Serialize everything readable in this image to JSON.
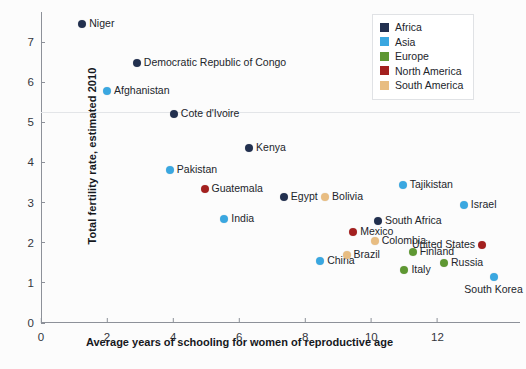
{
  "chart_data": {
    "type": "scatter",
    "title": "",
    "xlabel": "Average years of schooling for women of reproductive age",
    "ylabel": "Total fertility rate, estimated 2010",
    "xlim": [
      0,
      14.5
    ],
    "ylim": [
      0,
      7.75
    ],
    "xticks": [
      0,
      2,
      4,
      6,
      8,
      10,
      12
    ],
    "yticks": [
      0,
      1,
      2,
      3,
      4,
      5,
      6,
      7
    ],
    "xtick_labels": [
      "0",
      "2",
      "4",
      "6",
      "8",
      "10",
      "12"
    ],
    "ytick_labels": [
      "0",
      "1",
      "2",
      "3",
      "4",
      "5",
      "6",
      "7"
    ],
    "grid": "single faint horizontal rule at y=5.25",
    "hrule_y": 5.25,
    "legend_position": "top-right",
    "legend": [
      {
        "name": "Africa",
        "color": "#22304f"
      },
      {
        "name": "Asia",
        "color": "#3aa7e0"
      },
      {
        "name": "Europe",
        "color": "#5e9732"
      },
      {
        "name": "North America",
        "color": "#a3201f"
      },
      {
        "name": "South America",
        "color": "#e8bd82"
      }
    ],
    "series": [
      {
        "name": "Africa",
        "color": "#22304f",
        "points": [
          {
            "label": "Niger",
            "x": 1.25,
            "y": 7.45,
            "label_pos": "right"
          },
          {
            "label": "Democratic Republic of Congo",
            "x": 2.9,
            "y": 6.47,
            "label_pos": "right"
          },
          {
            "label": "Cote d'Ivoire",
            "x": 4.02,
            "y": 5.2,
            "label_pos": "right"
          },
          {
            "label": "Kenya",
            "x": 6.3,
            "y": 4.35,
            "label_pos": "right"
          },
          {
            "label": "Egypt",
            "x": 7.35,
            "y": 3.15,
            "label_pos": "right"
          },
          {
            "label": "South Africa",
            "x": 10.2,
            "y": 2.55,
            "label_pos": "right"
          }
        ]
      },
      {
        "name": "Asia",
        "color": "#3aa7e0",
        "points": [
          {
            "label": "Afghanistan",
            "x": 2.0,
            "y": 5.78,
            "label_pos": "right"
          },
          {
            "label": "Pakistan",
            "x": 3.9,
            "y": 3.82,
            "label_pos": "right"
          },
          {
            "label": "India",
            "x": 5.55,
            "y": 2.6,
            "label_pos": "right"
          },
          {
            "label": "Tajikistan",
            "x": 10.95,
            "y": 3.45,
            "label_pos": "right"
          },
          {
            "label": "Israel",
            "x": 12.8,
            "y": 2.95,
            "label_pos": "right"
          },
          {
            "label": "China",
            "x": 8.45,
            "y": 1.55,
            "label_pos": "right"
          },
          {
            "label": "South Korea",
            "x": 13.7,
            "y": 1.15,
            "label_pos": "below"
          }
        ]
      },
      {
        "name": "Europe",
        "color": "#5e9732",
        "points": [
          {
            "label": "Finland",
            "x": 11.25,
            "y": 1.77,
            "label_pos": "right"
          },
          {
            "label": "Italy",
            "x": 11.0,
            "y": 1.32,
            "label_pos": "right"
          },
          {
            "label": "Russia",
            "x": 12.2,
            "y": 1.5,
            "label_pos": "right"
          }
        ]
      },
      {
        "name": "North America",
        "color": "#a3201f",
        "points": [
          {
            "label": "Guatemala",
            "x": 4.95,
            "y": 3.33,
            "label_pos": "right"
          },
          {
            "label": "Mexico",
            "x": 9.45,
            "y": 2.28,
            "label_pos": "right"
          },
          {
            "label": "United States",
            "x": 13.35,
            "y": 1.95,
            "label_pos": "left"
          }
        ]
      },
      {
        "name": "South America",
        "color": "#e8bd82",
        "points": [
          {
            "label": "Bolivia",
            "x": 8.6,
            "y": 3.15,
            "label_pos": "right"
          },
          {
            "label": "Colombia",
            "x": 10.1,
            "y": 2.05,
            "label_pos": "right"
          },
          {
            "label": "Brazil",
            "x": 9.25,
            "y": 1.7,
            "label_pos": "right"
          }
        ]
      }
    ]
  }
}
